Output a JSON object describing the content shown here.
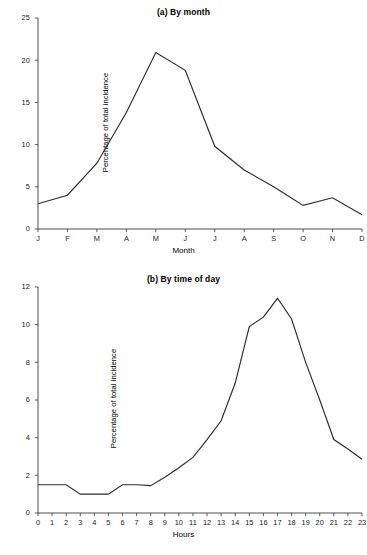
{
  "chart_data": [
    {
      "type": "line",
      "title": "(a) By month",
      "xlabel": "Month",
      "ylabel": "Percentage of total incidence",
      "categories": [
        "J",
        "F",
        "M",
        "A",
        "M",
        "J",
        "J",
        "A",
        "S",
        "O",
        "N",
        "D"
      ],
      "values": [
        3.0,
        4.0,
        7.8,
        13.8,
        20.9,
        18.8,
        9.8,
        7.0,
        5.0,
        2.8,
        3.7,
        1.7
      ],
      "ylim": [
        0,
        25
      ],
      "yticks": [
        0,
        5,
        10,
        15,
        20,
        25
      ],
      "ytick_labels": [
        "0",
        "5",
        "10",
        "15",
        "20",
        "25"
      ],
      "grid": false,
      "legend": "none"
    },
    {
      "type": "line",
      "title": "(b) By time of day",
      "xlabel": "Hours",
      "ylabel": "Percentage of total incidence",
      "categories": [
        "0",
        "1",
        "2",
        "3",
        "4",
        "5",
        "6",
        "7",
        "8",
        "9",
        "10",
        "11",
        "12",
        "13",
        "14",
        "15",
        "16",
        "17",
        "18",
        "19",
        "20",
        "21",
        "22",
        "23"
      ],
      "values": [
        1.5,
        1.5,
        1.5,
        1.0,
        1.0,
        1.0,
        1.5,
        1.5,
        1.45,
        1.9,
        2.4,
        2.95,
        3.9,
        4.9,
        6.9,
        9.9,
        10.4,
        11.4,
        10.3,
        8.0,
        6.0,
        3.9,
        3.4,
        2.85
      ],
      "ylim": [
        0,
        12
      ],
      "yticks": [
        0,
        2,
        4,
        6,
        8,
        10,
        12
      ],
      "ytick_labels": [
        "0",
        "2",
        "4",
        "6",
        "8",
        "10",
        "12"
      ],
      "grid": false,
      "legend": "none"
    }
  ]
}
